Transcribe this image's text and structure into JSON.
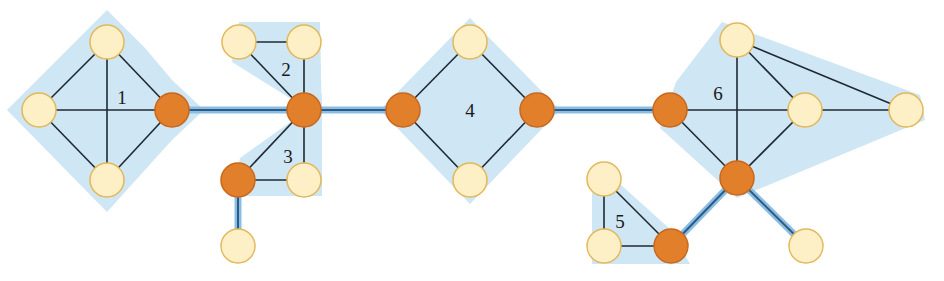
{
  "diagram": {
    "colors": {
      "block_fill": "#cfe6f5",
      "bridge_halo": "#8cbde2",
      "bridge_line": "#2c5b85",
      "edge": "#1f2a33",
      "cut_vertex_fill": "#e27f2b",
      "cut_vertex_stroke": "#c9681c",
      "vertex_fill": "#fdf0c6",
      "vertex_stroke": "#e3b85a"
    },
    "node_radius": 17,
    "nodes": [
      {
        "id": "a1",
        "x": 107,
        "y": 42,
        "cut": false
      },
      {
        "id": "a2",
        "x": 39,
        "y": 110,
        "cut": false
      },
      {
        "id": "a3",
        "x": 107,
        "y": 180,
        "cut": false
      },
      {
        "id": "c1",
        "x": 172,
        "y": 110,
        "cut": true
      },
      {
        "id": "b1",
        "x": 239,
        "y": 42,
        "cut": false
      },
      {
        "id": "b2",
        "x": 304,
        "y": 42,
        "cut": false
      },
      {
        "id": "c2",
        "x": 304,
        "y": 110,
        "cut": true
      },
      {
        "id": "c3",
        "x": 238,
        "y": 180,
        "cut": true
      },
      {
        "id": "b3",
        "x": 304,
        "y": 180,
        "cut": false
      },
      {
        "id": "p1",
        "x": 238,
        "y": 246,
        "cut": false
      },
      {
        "id": "c4",
        "x": 403,
        "y": 110,
        "cut": true
      },
      {
        "id": "d1",
        "x": 470,
        "y": 42,
        "cut": false
      },
      {
        "id": "d2",
        "x": 470,
        "y": 180,
        "cut": false
      },
      {
        "id": "c5",
        "x": 537,
        "y": 110,
        "cut": true
      },
      {
        "id": "c6",
        "x": 670,
        "y": 110,
        "cut": true
      },
      {
        "id": "e1",
        "x": 737,
        "y": 40,
        "cut": false
      },
      {
        "id": "e2",
        "x": 805,
        "y": 110,
        "cut": false
      },
      {
        "id": "e3",
        "x": 906,
        "y": 110,
        "cut": false
      },
      {
        "id": "c7",
        "x": 737,
        "y": 178,
        "cut": true
      },
      {
        "id": "f1",
        "x": 604,
        "y": 179,
        "cut": false
      },
      {
        "id": "f2",
        "x": 604,
        "y": 246,
        "cut": false
      },
      {
        "id": "c8",
        "x": 671,
        "y": 246,
        "cut": true
      },
      {
        "id": "p2",
        "x": 806,
        "y": 246,
        "cut": false
      }
    ],
    "blocks": [
      {
        "label": "1",
        "label_x": 122,
        "label_y": 104,
        "polygon": "107,10 145,48 172,80 204,110 172,140 107,212 7,110",
        "edges": [
          [
            "a1",
            "a2"
          ],
          [
            "a1",
            "c1"
          ],
          [
            "a2",
            "a3"
          ],
          [
            "a3",
            "c1"
          ],
          [
            "a1",
            "a3"
          ],
          [
            "a2",
            "c1"
          ]
        ]
      },
      {
        "label": "2",
        "label_x": 286,
        "label_y": 76,
        "polygon": "239,22 320,22 322,126 296,102 232,62",
        "edges": [
          [
            "b1",
            "b2"
          ],
          [
            "b2",
            "c2"
          ],
          [
            "b1",
            "c2"
          ]
        ]
      },
      {
        "label": "3",
        "label_x": 288,
        "label_y": 163,
        "polygon": "296,118 322,94 322,196 232,196 240,158",
        "edges": [
          [
            "c2",
            "b3"
          ],
          [
            "c3",
            "b3"
          ],
          [
            "c2",
            "c3"
          ]
        ]
      },
      {
        "label": "4",
        "label_x": 470,
        "label_y": 117,
        "polygon": "470,18 560,110 470,204 380,110",
        "edges": [
          [
            "c4",
            "d1"
          ],
          [
            "d1",
            "c5"
          ],
          [
            "c5",
            "d2"
          ],
          [
            "d2",
            "c4"
          ]
        ]
      },
      {
        "label": "5",
        "label_x": 620,
        "label_y": 228,
        "polygon": "592,170 620,184 671,230 690,264 592,264",
        "edges": [
          [
            "f1",
            "f2"
          ],
          [
            "f2",
            "c8"
          ],
          [
            "f1",
            "c8"
          ]
        ]
      },
      {
        "label": "6",
        "label_x": 718,
        "label_y": 100,
        "polygon": "722,22 920,95 925,120 737,198 660,128 676,82",
        "edges": [
          [
            "c6",
            "e2"
          ],
          [
            "c6",
            "c7"
          ],
          [
            "e1",
            "c7"
          ],
          [
            "e1",
            "e2"
          ],
          [
            "e1",
            "e3"
          ],
          [
            "e2",
            "e3"
          ],
          [
            "e2",
            "c7"
          ]
        ]
      }
    ],
    "bridges": [
      [
        "c1",
        "c2"
      ],
      [
        "c2",
        "c4"
      ],
      [
        "c5",
        "c6"
      ],
      [
        "c3",
        "p1"
      ],
      [
        "c7",
        "c8"
      ],
      [
        "c7",
        "p2"
      ]
    ]
  }
}
